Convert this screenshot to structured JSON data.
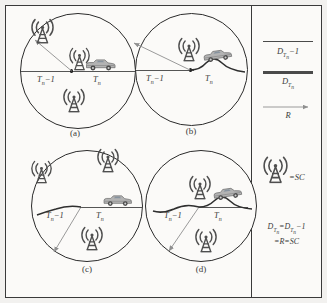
{
  "figure": {
    "name": "coverage-circles-diagram",
    "panel_count": 4,
    "colors": {
      "outer_background": "#f2f1ef",
      "inner_background": "#fbfaf8",
      "frame_border": "#3a3a3a",
      "circle_stroke": "#2b2b2b",
      "axis_line": "#555555",
      "arrow": "#8a8a8a",
      "text": "#3a3a3a",
      "tower": "#4a4a4a",
      "car_body": "#a9a9a9",
      "car_window": "#7f8c9b"
    }
  },
  "panels": [
    {
      "id": "a",
      "caption": "(a)",
      "left_label": "T",
      "left_label_sub": "n",
      "left_label_suffix": "−1",
      "right_label": "T",
      "right_label_sub": "n",
      "terrain": "straight",
      "tower_count": 3,
      "tower_positions": [
        "upper-left",
        "center",
        "bottom-center"
      ],
      "arrow_direction": "up-left",
      "car": true
    },
    {
      "id": "b",
      "caption": "(b)",
      "left_label": "T",
      "left_label_sub": "n",
      "left_label_suffix": "−1",
      "right_label": "T",
      "right_label_sub": "n",
      "terrain": "curved",
      "tower_count": 1,
      "tower_positions": [
        "center-top"
      ],
      "arrow_direction": "up-left",
      "car": true
    },
    {
      "id": "c",
      "caption": "(c)",
      "left_label": "T",
      "left_label_sub": "n",
      "left_label_suffix": "−1",
      "right_label": "T",
      "right_label_sub": "n",
      "terrain": "curved-left",
      "tower_count": 3,
      "tower_positions": [
        "upper-left",
        "upper-right",
        "bottom-center"
      ],
      "arrow_direction": "down-left",
      "car": true
    },
    {
      "id": "d",
      "caption": "(d)",
      "left_label": "T",
      "left_label_sub": "n",
      "left_label_suffix": "−1",
      "right_label": "T",
      "right_label_sub": "n",
      "terrain": "curved",
      "tower_count": 2,
      "tower_positions": [
        "center-top",
        "bottom-center"
      ],
      "arrow_direction": "down-left",
      "car": true
    }
  ],
  "legend": {
    "entries": [
      {
        "style": "thin-line",
        "label_main": "D",
        "label_sub": "T",
        "label_subsub": "n",
        "label_suffix": "−1"
      },
      {
        "style": "thick-line",
        "label_main": "D",
        "label_sub": "T",
        "label_subsub": "n",
        "label_suffix": ""
      },
      {
        "style": "arrow",
        "label_main": "R",
        "label_sub": "",
        "label_subsub": "",
        "label_suffix": ""
      }
    ],
    "icon_entry": {
      "icon": "signal-tower-icon",
      "text": "=SC"
    },
    "equation": {
      "line1_a": "D",
      "line1_a_sub": "T",
      "line1_a_subsub": "n",
      "line1_mid": "=D",
      "line1_b_sub": "T",
      "line1_b_subsub": "n",
      "line1_end": "−1",
      "line2": "=R=SC"
    }
  }
}
